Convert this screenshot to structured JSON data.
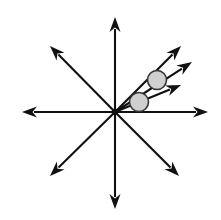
{
  "figure": {
    "background_color": "#ffffff",
    "line_color": "#111111",
    "circle_fill_color": "#cfcfcf",
    "circle_stroke_color": "#333333",
    "width": 221,
    "height": 220
  },
  "chart_data": {
    "type": "scatter",
    "xlabel": "",
    "ylabel": "",
    "grid": false,
    "legend": null,
    "xlim": [
      0,
      221
    ],
    "ylim": [
      0,
      220
    ],
    "origin": {
      "x": 115,
      "y": 112
    },
    "rays": [
      {
        "name": "ray-north",
        "angle_deg": 90,
        "tip_x": 115,
        "tip_y": 17,
        "length": 95
      },
      {
        "name": "ray-northeast",
        "angle_deg": 45,
        "tip_x": 181,
        "tip_y": 46,
        "length": 94
      },
      {
        "name": "ray-east",
        "angle_deg": 0,
        "tip_x": 208,
        "tip_y": 112,
        "length": 93
      },
      {
        "name": "ray-southeast",
        "angle_deg": -45,
        "tip_x": 179,
        "tip_y": 176,
        "length": 91
      },
      {
        "name": "ray-south",
        "angle_deg": -90,
        "tip_x": 115,
        "tip_y": 209,
        "length": 97
      },
      {
        "name": "ray-southwest",
        "angle_deg": 225,
        "tip_x": 50,
        "tip_y": 176,
        "length": 93
      },
      {
        "name": "ray-west",
        "angle_deg": 180,
        "tip_x": 22,
        "tip_y": 112,
        "length": 93
      },
      {
        "name": "ray-northwest",
        "angle_deg": 135,
        "tip_x": 50,
        "tip_y": 46,
        "length": 93
      },
      {
        "name": "ray-upper-right-mid",
        "angle_deg": 27,
        "tip_x": 192,
        "tip_y": 62,
        "length": 86
      },
      {
        "name": "ray-upper-right-lower",
        "angle_deg": 17,
        "tip_x": 181,
        "tip_y": 85,
        "length": 69
      }
    ],
    "angle_markers": [
      {
        "name": "angle-marker-upper",
        "cx": 157,
        "cy": 80,
        "r": 9.5
      },
      {
        "name": "angle-marker-lower",
        "cx": 139,
        "cy": 102,
        "r": 9.5
      }
    ]
  }
}
